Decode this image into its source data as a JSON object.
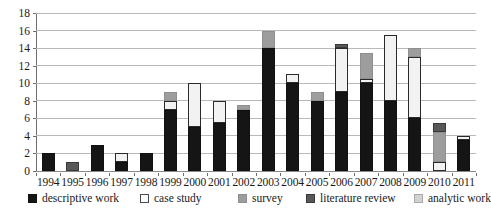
{
  "chart_data": {
    "type": "bar",
    "stacked": true,
    "title": "",
    "xlabel": "",
    "ylabel": "",
    "ylim": [
      0,
      18
    ],
    "ytick_values": [
      0,
      2,
      4,
      6,
      8,
      10,
      12,
      14,
      16,
      18
    ],
    "ytick_labels": [
      "0",
      "2",
      "4",
      "6",
      "8",
      "10",
      "12",
      "14",
      "16",
      "18"
    ],
    "grid": true,
    "legend_position": "bottom",
    "categories": [
      "1994",
      "1995",
      "1996",
      "1997",
      "1998",
      "1999",
      "2000",
      "2001",
      "2002",
      "2003",
      "2004",
      "2005",
      "2006",
      "2007",
      "2008",
      "2009",
      "2010",
      "2011"
    ],
    "series": [
      {
        "name": "descriptive work",
        "color": "#151515",
        "values": [
          2,
          0,
          3,
          1,
          2,
          7,
          5,
          5.5,
          7,
          14,
          10,
          8,
          9,
          10,
          8,
          6,
          0,
          3.5
        ]
      },
      {
        "name": "case study",
        "color": "#f2f2f2",
        "values": [
          0,
          0,
          0,
          1,
          0,
          1,
          5,
          2.5,
          0,
          0,
          1,
          0,
          5,
          0.5,
          7.5,
          7,
          1,
          0.5
        ]
      },
      {
        "name": "survey",
        "color": "#9d9d9d",
        "values": [
          0,
          0,
          0,
          0,
          0,
          1,
          0,
          0,
          0.5,
          2,
          0,
          1,
          0,
          3,
          0,
          1,
          3.5,
          0
        ]
      },
      {
        "name": "literature review",
        "color": "#585858",
        "values": [
          0,
          1,
          0,
          0,
          0,
          0,
          0,
          0,
          0,
          0,
          0,
          0,
          0.5,
          0,
          0,
          0,
          1,
          0
        ]
      },
      {
        "name": "analytic work",
        "color": "#d2d2d2",
        "values": [
          0,
          0,
          0,
          0,
          0,
          0,
          0,
          0,
          0,
          0,
          0,
          0,
          0,
          0,
          0,
          0,
          0,
          0
        ]
      }
    ],
    "totals": [
      2,
      1,
      3,
      2,
      2,
      9,
      10,
      8,
      7.5,
      16,
      11,
      9,
      14.5,
      13.5,
      15.5,
      14,
      5.5,
      4
    ]
  },
  "legend": {
    "items": [
      {
        "label": "descriptive work",
        "swatch": "descriptive"
      },
      {
        "label": "case study",
        "swatch": "case"
      },
      {
        "label": "survey",
        "swatch": "survey"
      },
      {
        "label": "literature review",
        "swatch": "literature"
      },
      {
        "label": "analytic work",
        "swatch": "analytic"
      }
    ]
  }
}
